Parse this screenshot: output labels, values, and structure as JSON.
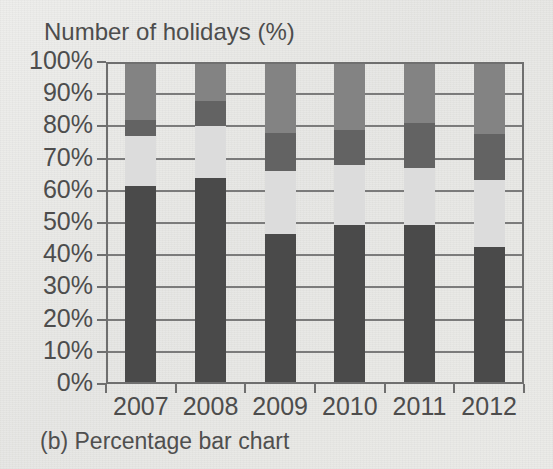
{
  "figure": {
    "title": "Number of holidays (%)",
    "caption": "(b) Percentage bar chart"
  },
  "colors": {
    "series_1": "#4a4a4a",
    "series_2": "#dcdcdc",
    "series_3": "#636363",
    "series_4": "#838383",
    "axis": "#6f6f6f",
    "gridline": "#7b7b7b",
    "text": "#4d4d4d",
    "paper": "#eaeae7"
  },
  "chart_data": {
    "type": "bar",
    "title": "Number of holidays (%)",
    "xlabel": "",
    "ylabel": "Number of holidays (%)",
    "stacked": true,
    "normalized": true,
    "grid": true,
    "legend": "none",
    "ylim": [
      0,
      100
    ],
    "ytick_labels": [
      "0%",
      "10%",
      "20%",
      "30%",
      "40%",
      "50%",
      "60%",
      "70%",
      "80%",
      "90%",
      "100%"
    ],
    "ytick_values": [
      0,
      10,
      20,
      30,
      40,
      50,
      60,
      70,
      80,
      90,
      100
    ],
    "categories": [
      "2007",
      "2008",
      "2009",
      "2010",
      "2011",
      "2012"
    ],
    "series": [
      {
        "name": "series-1",
        "color": "#4a4a4a",
        "values": [
          61.5,
          64.0,
          46.5,
          49.5,
          49.5,
          42.5
        ]
      },
      {
        "name": "series-2",
        "color": "#dcdcdc",
        "values": [
          15.5,
          16.0,
          19.5,
          18.5,
          17.5,
          21.0
        ]
      },
      {
        "name": "series-3",
        "color": "#636363",
        "values": [
          5.0,
          8.0,
          12.0,
          11.0,
          14.0,
          14.0
        ]
      },
      {
        "name": "series-4",
        "color": "#838383",
        "values": [
          18.0,
          12.0,
          22.0,
          21.0,
          19.0,
          22.5
        ]
      }
    ]
  }
}
